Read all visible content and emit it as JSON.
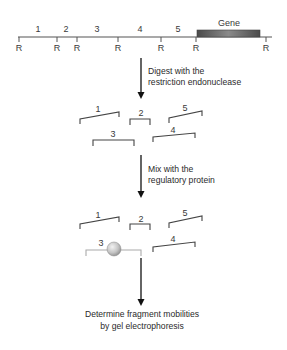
{
  "restriction_map": {
    "site_label": "R",
    "site_x": [
      19,
      57,
      77,
      118,
      161,
      196,
      266
    ],
    "fragment_labels": [
      "1",
      "2",
      "3",
      "4",
      "5"
    ],
    "gene_label": "Gene",
    "colors": {
      "line": "#555555",
      "gene_dark": "#555555",
      "gene_light": "#9a9a9a"
    }
  },
  "steps": [
    {
      "line1": "Digest with the",
      "line2": "restriction endonuclease"
    },
    {
      "line1": "Mix with the",
      "line2": "regulatory protein"
    },
    {
      "line1": "Determine fragment mobilities",
      "line2": "by gel electrophoresis"
    }
  ],
  "digested_fragments": {
    "labels": [
      "1",
      "2",
      "3",
      "4",
      "5"
    ]
  },
  "bound_fragments": {
    "labels": [
      "1",
      "2",
      "3",
      "4",
      "5"
    ],
    "protein_bound_fragment": "3",
    "colors": {
      "bound_fragment": "#aaaaaa",
      "protein": "#c8c8c8"
    }
  }
}
